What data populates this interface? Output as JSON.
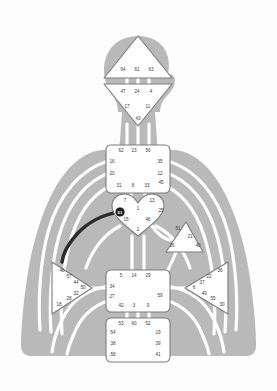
{
  "chart": {
    "colors": {
      "background": "#fdfdfd",
      "body_silhouette": "#b9b9b9",
      "channel_line": "#ffffff",
      "center_fill": "#ffffff",
      "center_stroke": "#8a8a8a",
      "gate_text": "#3a3a3a",
      "activated_channel": "#2b2b2b",
      "activated_gate_fill": "#1e1e1e",
      "activated_gate_text": "#ffffff"
    },
    "centers": [
      {
        "name": "head",
        "label": "Head Center",
        "shape": "triangle-up",
        "defined": false,
        "gates": [
          "64",
          "61",
          "63"
        ]
      },
      {
        "name": "ajna",
        "label": "Ajna Center",
        "shape": "triangle-down",
        "defined": false,
        "gates": [
          "47",
          "24",
          "4",
          "17",
          "11",
          "43"
        ]
      },
      {
        "name": "throat",
        "label": "Throat Center",
        "shape": "square",
        "defined": false,
        "gates": [
          "62",
          "23",
          "56",
          "16",
          "35",
          "20",
          "12",
          "45",
          "31",
          "8",
          "33"
        ]
      },
      {
        "name": "g-center",
        "label": "G Center",
        "shape": "heart",
        "defined": false,
        "gates": [
          "7",
          "1",
          "13",
          "15",
          "46",
          "25",
          "2"
        ]
      },
      {
        "name": "ego",
        "label": "Ego / Will Center",
        "shape": "triangle-right",
        "defined": false,
        "gates": [
          "51",
          "21",
          "26",
          "40"
        ]
      },
      {
        "name": "spleen",
        "label": "Spleen Center",
        "shape": "triangle-right",
        "defined": false,
        "gates": [
          "48",
          "57",
          "44",
          "50",
          "32",
          "28",
          "18"
        ]
      },
      {
        "name": "solar-plexus",
        "label": "Solar Plexus Center",
        "shape": "triangle-left",
        "defined": false,
        "gates": [
          "36",
          "22",
          "37",
          "6",
          "49",
          "55",
          "30"
        ]
      },
      {
        "name": "sacral",
        "label": "Sacral Center",
        "shape": "square",
        "defined": false,
        "gates": [
          "5",
          "14",
          "29",
          "34",
          "59",
          "27",
          "42",
          "3",
          "9"
        ]
      },
      {
        "name": "root",
        "label": "Root Center",
        "shape": "square",
        "defined": false,
        "gates": [
          "53",
          "60",
          "52",
          "54",
          "19",
          "38",
          "39",
          "58",
          "41"
        ]
      }
    ],
    "activated_gate": {
      "number": "51",
      "center": "ego"
    },
    "head_gates": [
      {
        "t": "64",
        "x": 123,
        "y": 71
      },
      {
        "t": "61",
        "x": 137,
        "y": 71
      },
      {
        "t": "63",
        "x": 151,
        "y": 71
      }
    ],
    "ajna_gates": [
      {
        "t": "47",
        "x": 123,
        "y": 93
      },
      {
        "t": "24",
        "x": 137,
        "y": 93
      },
      {
        "t": "4",
        "x": 151,
        "y": 93
      },
      {
        "t": "17",
        "x": 127,
        "y": 108
      },
      {
        "t": "11",
        "x": 148,
        "y": 108
      },
      {
        "t": "43",
        "x": 138,
        "y": 120
      }
    ],
    "throat_gates": [
      {
        "t": "62",
        "x": 121,
        "y": 152
      },
      {
        "t": "23",
        "x": 134,
        "y": 152
      },
      {
        "t": "56",
        "x": 148,
        "y": 152
      },
      {
        "t": "16",
        "x": 112,
        "y": 163
      },
      {
        "t": "35",
        "x": 160,
        "y": 163
      },
      {
        "t": "20",
        "x": 112,
        "y": 175
      },
      {
        "t": "12",
        "x": 160,
        "y": 175
      },
      {
        "t": "45",
        "x": 161,
        "y": 184
      },
      {
        "t": "31",
        "x": 119,
        "y": 187
      },
      {
        "t": "8",
        "x": 133,
        "y": 187
      },
      {
        "t": "33",
        "x": 147,
        "y": 187
      }
    ],
    "g_gates": [
      {
        "t": "7",
        "x": 125,
        "y": 202
      },
      {
        "t": "13",
        "x": 152,
        "y": 202
      },
      {
        "t": "1",
        "x": 138,
        "y": 210
      },
      {
        "t": "25",
        "x": 161,
        "y": 212
      },
      {
        "t": "15",
        "x": 126,
        "y": 221
      },
      {
        "t": "46",
        "x": 148,
        "y": 221
      },
      {
        "t": "2",
        "x": 138,
        "y": 231
      }
    ],
    "ego_gates": [
      {
        "t": "51",
        "x": 178,
        "y": 230
      },
      {
        "t": "21",
        "x": 190,
        "y": 238
      },
      {
        "t": "26",
        "x": 172,
        "y": 247
      },
      {
        "t": "40",
        "x": 198,
        "y": 247
      }
    ],
    "spleen_gates": [
      {
        "t": "48",
        "x": 62,
        "y": 272
      },
      {
        "t": "57",
        "x": 69,
        "y": 278
      },
      {
        "t": "44",
        "x": 76,
        "y": 284
      },
      {
        "t": "50",
        "x": 83,
        "y": 288
      },
      {
        "t": "32",
        "x": 76,
        "y": 294
      },
      {
        "t": "28",
        "x": 69,
        "y": 299
      },
      {
        "t": "18",
        "x": 59,
        "y": 304
      }
    ],
    "solar_gates": [
      {
        "t": "36",
        "x": 220,
        "y": 271
      },
      {
        "t": "22",
        "x": 209,
        "y": 277
      },
      {
        "t": "37",
        "x": 202,
        "y": 283
      },
      {
        "t": "6",
        "x": 194,
        "y": 288
      },
      {
        "t": "49",
        "x": 204,
        "y": 294
      },
      {
        "t": "55",
        "x": 213,
        "y": 299
      },
      {
        "t": "30",
        "x": 222,
        "y": 304
      }
    ],
    "sacral_gates": [
      {
        "t": "5",
        "x": 121,
        "y": 277
      },
      {
        "t": "14",
        "x": 134,
        "y": 277
      },
      {
        "t": "29",
        "x": 148,
        "y": 277
      },
      {
        "t": "34",
        "x": 112,
        "y": 288
      },
      {
        "t": "59",
        "x": 160,
        "y": 296
      },
      {
        "t": "27",
        "x": 112,
        "y": 297
      },
      {
        "t": "42",
        "x": 121,
        "y": 306
      },
      {
        "t": "3",
        "x": 134,
        "y": 306
      },
      {
        "t": "9",
        "x": 148,
        "y": 306
      }
    ],
    "root_gates": [
      {
        "t": "53",
        "x": 121,
        "y": 324
      },
      {
        "t": "60",
        "x": 134,
        "y": 324
      },
      {
        "t": "52",
        "x": 148,
        "y": 324
      },
      {
        "t": "54",
        "x": 113,
        "y": 333
      },
      {
        "t": "19",
        "x": 158,
        "y": 333
      },
      {
        "t": "38",
        "x": 113,
        "y": 344
      },
      {
        "t": "39",
        "x": 158,
        "y": 344
      },
      {
        "t": "58",
        "x": 113,
        "y": 355
      },
      {
        "t": "41",
        "x": 158,
        "y": 355
      }
    ]
  }
}
